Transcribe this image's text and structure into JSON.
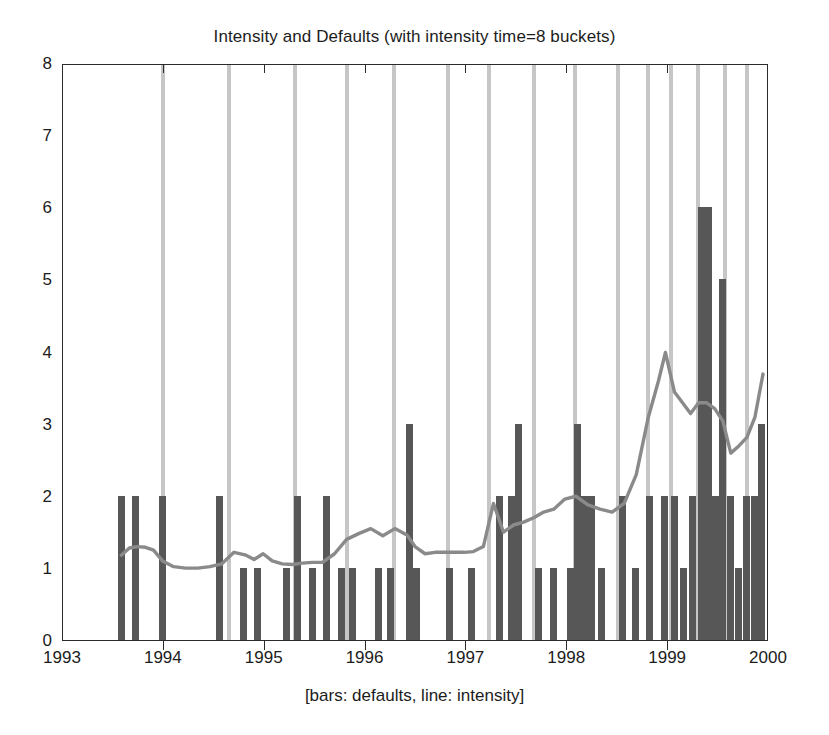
{
  "chart_data": {
    "type": "bar",
    "title": "Intensity and Defaults (with intensity time=8 buckets)",
    "caption": "[bars: defaults, line: intensity]",
    "xlabel": "",
    "ylabel": "",
    "xlim": [
      1993,
      2000
    ],
    "ylim": [
      0,
      8
    ],
    "xticks": [
      1993,
      1994,
      1995,
      1996,
      1997,
      1998,
      1999,
      2000
    ],
    "yticks": [
      0,
      1,
      2,
      3,
      4,
      5,
      6,
      7,
      8
    ],
    "grid": false,
    "legend_position": "below-axis-as-caption",
    "colors": {
      "bars": "#575757",
      "line": "#8a8a8a",
      "bucket_lines": "#c6c6c6",
      "frame": "#2b2b2b",
      "background": "#ffffff"
    },
    "series": [
      {
        "name": "defaults",
        "type": "bar",
        "x": [
          1993.58,
          1993.72,
          1993.99,
          1994.55,
          1994.79,
          1994.93,
          1995.22,
          1995.33,
          1995.47,
          1995.61,
          1995.76,
          1995.87,
          1996.13,
          1996.25,
          1996.44,
          1996.5,
          1996.83,
          1997.05,
          1997.33,
          1997.45,
          1997.52,
          1997.71,
          1997.86,
          1998.03,
          1998.1,
          1998.17,
          1998.24,
          1998.34,
          1998.55,
          1998.68,
          1998.82,
          1998.96,
          1999.06,
          1999.15,
          1999.24,
          1999.33,
          1999.4,
          1999.47,
          1999.54,
          1999.62,
          1999.7,
          1999.78,
          1999.86,
          1999.93
        ],
        "values": [
          2,
          2,
          2,
          2,
          1,
          1,
          1,
          2,
          1,
          2,
          1,
          1,
          1,
          1,
          3,
          1,
          1,
          1,
          2,
          2,
          3,
          1,
          1,
          1,
          3,
          2,
          2,
          1,
          2,
          1,
          2,
          2,
          2,
          1,
          2,
          6,
          6,
          2,
          5,
          2,
          1,
          2,
          2,
          3
        ]
      },
      {
        "name": "intensity",
        "type": "line",
        "x": [
          1993.58,
          1993.66,
          1993.74,
          1993.82,
          1993.9,
          1993.99,
          1994.1,
          1994.22,
          1994.34,
          1994.46,
          1994.58,
          1994.7,
          1994.82,
          1994.9,
          1994.99,
          1995.08,
          1995.18,
          1995.28,
          1995.38,
          1995.48,
          1995.58,
          1995.7,
          1995.82,
          1995.94,
          1996.06,
          1996.18,
          1996.3,
          1996.42,
          1996.5,
          1996.6,
          1996.7,
          1996.82,
          1996.9,
          1996.99,
          1997.08,
          1997.18,
          1997.28,
          1997.38,
          1997.48,
          1997.58,
          1997.68,
          1997.78,
          1997.88,
          1997.99,
          1998.1,
          1998.22,
          1998.34,
          1998.46,
          1998.58,
          1998.7,
          1998.82,
          1998.92,
          1998.99,
          1999.08,
          1999.16,
          1999.24,
          1999.32,
          1999.4,
          1999.48,
          1999.56,
          1999.64,
          1999.72,
          1999.8,
          1999.88,
          1999.96
        ],
        "values": [
          1.18,
          1.28,
          1.3,
          1.29,
          1.25,
          1.1,
          1.02,
          1.0,
          1.0,
          1.02,
          1.06,
          1.22,
          1.18,
          1.12,
          1.2,
          1.1,
          1.06,
          1.05,
          1.07,
          1.08,
          1.08,
          1.2,
          1.4,
          1.48,
          1.55,
          1.45,
          1.55,
          1.46,
          1.3,
          1.2,
          1.22,
          1.22,
          1.22,
          1.22,
          1.23,
          1.3,
          1.9,
          1.5,
          1.6,
          1.64,
          1.7,
          1.78,
          1.82,
          1.96,
          2.0,
          1.88,
          1.82,
          1.78,
          1.9,
          2.3,
          3.1,
          3.6,
          4.0,
          3.45,
          3.3,
          3.15,
          3.3,
          3.3,
          3.22,
          3.05,
          2.6,
          2.7,
          2.82,
          3.1,
          3.7
        ]
      }
    ],
    "bucket_boundaries": [
      1993.99,
      1994.65,
      1995.3,
      1995.82,
      1996.28,
      1996.82,
      1997.22,
      1997.67,
      1998.08,
      1998.5,
      1998.8,
      1999.03,
      1999.3,
      1999.56,
      1999.78
    ]
  }
}
